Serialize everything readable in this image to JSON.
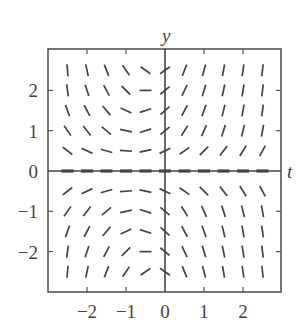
{
  "chart_data": {
    "type": "slope_field",
    "title": "",
    "xlabel": "t",
    "ylabel": "y",
    "xlim": [
      -3,
      3
    ],
    "ylim": [
      -3,
      3
    ],
    "grid": false,
    "legend": null,
    "x_ticks": [
      -2,
      -1,
      0,
      1,
      2
    ],
    "y_ticks": [
      2,
      1,
      0,
      -1,
      -2
    ],
    "x_tick_labels": [
      "−2",
      "−1",
      "0",
      "1",
      "2"
    ],
    "y_tick_labels": [
      "2",
      "1",
      "0",
      "−1",
      "−2"
    ],
    "sample_t": [
      -2.5,
      -2.0,
      -1.5,
      -1.0,
      -0.5,
      0.0,
      0.5,
      1.0,
      1.5,
      2.0,
      2.5
    ],
    "sample_y": [
      2.5,
      2.0,
      1.5,
      1.0,
      0.5,
      0.0,
      -0.5,
      -1.0,
      -1.5,
      -2.0,
      -2.5
    ],
    "segment_angles_deg": [
      [
        -85,
        -78,
        -68,
        -55,
        -35,
        35,
        68,
        75,
        80,
        82,
        84
      ],
      [
        -82,
        -72,
        -62,
        -45,
        0,
        40,
        65,
        73,
        78,
        81,
        83
      ],
      [
        -70,
        -62,
        -50,
        -25,
        18,
        42,
        62,
        70,
        76,
        80,
        82
      ],
      [
        -55,
        -52,
        -40,
        -12,
        18,
        40,
        58,
        66,
        72,
        76,
        80
      ],
      [
        -38,
        -25,
        -16,
        -4,
        12,
        25,
        35,
        45,
        52,
        58,
        62
      ],
      [
        0,
        0,
        0,
        0,
        0,
        0,
        0,
        0,
        0,
        0,
        0
      ],
      [
        38,
        25,
        16,
        4,
        -12,
        -25,
        -35,
        -45,
        -52,
        -58,
        -62
      ],
      [
        55,
        52,
        40,
        12,
        -18,
        -40,
        -58,
        -66,
        -72,
        -76,
        -80
      ],
      [
        70,
        62,
        50,
        25,
        -18,
        -42,
        -62,
        -70,
        -76,
        -80,
        -82
      ],
      [
        82,
        72,
        62,
        45,
        0,
        -40,
        -65,
        -73,
        -78,
        -81,
        -83
      ],
      [
        85,
        78,
        68,
        55,
        35,
        -35,
        -68,
        -75,
        -80,
        -82,
        -84
      ]
    ],
    "equilibrium_solution": "y = 0"
  },
  "colors": {
    "axis": "#555555",
    "segment": "#444444",
    "text": "#444444",
    "background": "#ffffff"
  },
  "layout": {
    "plot_left": 48,
    "plot_top": 49,
    "plot_right": 281,
    "plot_bottom": 292,
    "origin_x": 165,
    "origin_y": 171,
    "px_per_unit_x": 39,
    "px_per_unit_y": 40.3,
    "segment_length": 12
  }
}
